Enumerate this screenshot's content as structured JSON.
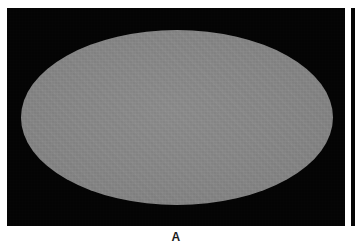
{
  "figure": {
    "panels": [
      {
        "id": "A",
        "caption": "A",
        "content_type": "ellipse-region",
        "background_color": "#030303",
        "shape": {
          "name": "ellipse",
          "fill_color": "#878787",
          "center_x": 177,
          "center_y": 117,
          "radius_x": 156,
          "radius_y": 87
        },
        "frame": {
          "x": 7,
          "y": 8,
          "width": 338,
          "height": 218
        }
      },
      {
        "id": "B",
        "caption": "",
        "content_type": "clipped-neighbor-panel",
        "background_color": "#050505",
        "frame": {
          "x": 351,
          "y": 8,
          "width": 4,
          "height": 218
        }
      }
    ],
    "page_background": "#ffffff"
  }
}
